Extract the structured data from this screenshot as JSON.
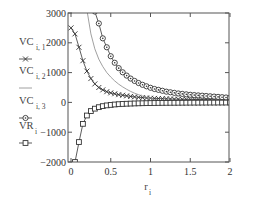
{
  "chart_data": {
    "type": "line",
    "title": "",
    "xlabel": "r",
    "xlabel_sub": "i",
    "ylabel": "",
    "xlim": [
      -0.02,
      2
    ],
    "ylim": [
      -2000,
      3000
    ],
    "grid": false,
    "legend_position": "left",
    "x_ticks": [
      0,
      0.5,
      1,
      1.5,
      2
    ],
    "x_tick_labels": [
      "0",
      "0.5",
      "1",
      "1.5",
      "2"
    ],
    "y_ticks": [
      3000,
      2000,
      1000,
      0,
      -1000,
      -2000
    ],
    "y_tick_labels": [
      "3000",
      "2000",
      "1000",
      "0",
      "−1000",
      "−2000"
    ],
    "x": [
      0,
      0.05,
      0.1,
      0.15,
      0.2,
      0.25,
      0.3,
      0.35,
      0.4,
      0.45,
      0.5,
      0.55,
      0.6,
      0.65,
      0.7,
      0.75,
      0.8,
      0.85,
      0.9,
      0.95,
      1.0,
      1.05,
      1.1,
      1.15,
      1.2,
      1.25,
      1.3,
      1.35,
      1.4,
      1.45,
      1.5,
      1.55,
      1.6,
      1.65,
      1.7,
      1.75,
      1.8,
      1.85,
      1.9,
      1.95,
      2.0
    ],
    "series": [
      {
        "name": "VC",
        "sub": "i, 1",
        "marker": "x",
        "values": [
          2500,
          2300,
          1850,
          1400,
          1050,
          800,
          620,
          500,
          420,
          360,
          320,
          290,
          260,
          240,
          220,
          200,
          185,
          170,
          160,
          150,
          140,
          135,
          130,
          125,
          120,
          115,
          110,
          108,
          105,
          102,
          100,
          98,
          96,
          94,
          92,
          90,
          88,
          86,
          85,
          84,
          82
        ]
      },
      {
        "name": "VC",
        "sub": "i, 2",
        "marker": "none",
        "values": [
          null,
          null,
          null,
          null,
          3100,
          2300,
          1800,
          1450,
          1200,
          1000,
          850,
          720,
          610,
          520,
          440,
          370,
          310,
          260,
          210,
          170,
          130,
          100,
          75,
          55,
          40,
          30,
          20,
          15,
          10,
          8,
          5,
          3,
          2,
          1,
          0,
          0,
          0,
          0,
          0,
          0,
          0
        ]
      },
      {
        "name": "VC",
        "sub": "i, 3",
        "marker": "diamond",
        "values": [
          null,
          null,
          null,
          null,
          null,
          null,
          3050,
          2650,
          2150,
          1850,
          1550,
          1330,
          1150,
          1010,
          900,
          800,
          720,
          650,
          590,
          540,
          490,
          450,
          420,
          390,
          360,
          340,
          320,
          300,
          285,
          270,
          255,
          245,
          235,
          225,
          215,
          205,
          195,
          185,
          175,
          165,
          155
        ]
      },
      {
        "name": "VR",
        "sub": "i",
        "marker": "square",
        "values": [
          null,
          -2000,
          -1330,
          -720,
          -440,
          -290,
          -210,
          -160,
          -125,
          -100,
          -85,
          -70,
          -60,
          -52,
          -45,
          -40,
          -35,
          -31,
          -28,
          -25,
          -22,
          -20,
          -18,
          -16,
          -15,
          -14,
          -13,
          -12,
          -11,
          -10,
          -9,
          -8,
          -8,
          -7,
          -7,
          -6,
          -6,
          -5,
          -5,
          -5,
          -4
        ]
      }
    ]
  },
  "colors": {
    "frame": "#555555",
    "series": "#333333",
    "line_only": "#888888"
  }
}
